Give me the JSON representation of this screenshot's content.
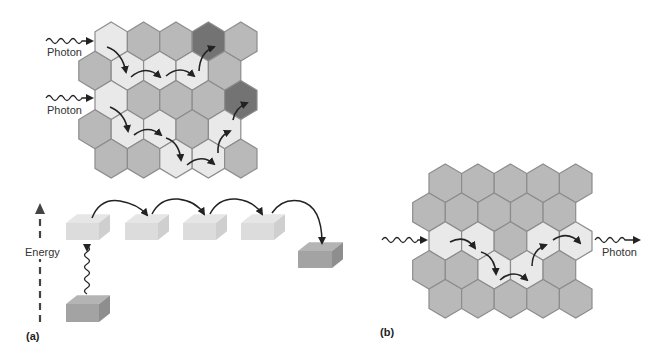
{
  "colors": {
    "light": "#e9e9e9",
    "gray": "#b9b9b9",
    "dark": "#737373",
    "outline": "#8c8c8c",
    "arrow": "#222222",
    "block_light_front": "#dcdcdc",
    "block_light_top": "#e6e6e6",
    "block_light_side": "#cfcfcf",
    "block_dark_front": "#a3a3a3",
    "block_dark_top": "#b4b4b4",
    "block_dark_side": "#8e8e8e"
  },
  "panel_a": {
    "label": "(a)",
    "photon_labels": [
      "Photon",
      "Photon"
    ],
    "energy_label": "Energy",
    "grid": {
      "rows": [
        [
          "light",
          "gray",
          "gray",
          "dark",
          "gray"
        ],
        [
          "gray",
          "light",
          "light",
          "light",
          "gray"
        ],
        [
          "light",
          "gray",
          "gray",
          "gray",
          "dark"
        ],
        [
          "gray",
          "light",
          "light",
          "gray",
          "light"
        ],
        [
          "gray",
          "gray",
          "light",
          "light",
          "gray"
        ]
      ]
    },
    "energy_levels": [
      "ground",
      "excited",
      "excited",
      "excited",
      "excited",
      "trap"
    ]
  },
  "panel_b": {
    "label": "(b)",
    "photon_label": "Photon",
    "grid": {
      "rows": [
        [
          "gray",
          "gray",
          "gray",
          "gray",
          "gray"
        ],
        [
          "gray",
          "gray",
          "gray",
          "gray",
          "gray"
        ],
        [
          "light",
          "light",
          "gray",
          "light",
          "light"
        ],
        [
          "gray",
          "gray",
          "light",
          "light",
          "gray"
        ],
        [
          "gray",
          "gray",
          "gray",
          "gray",
          "gray"
        ]
      ]
    }
  }
}
